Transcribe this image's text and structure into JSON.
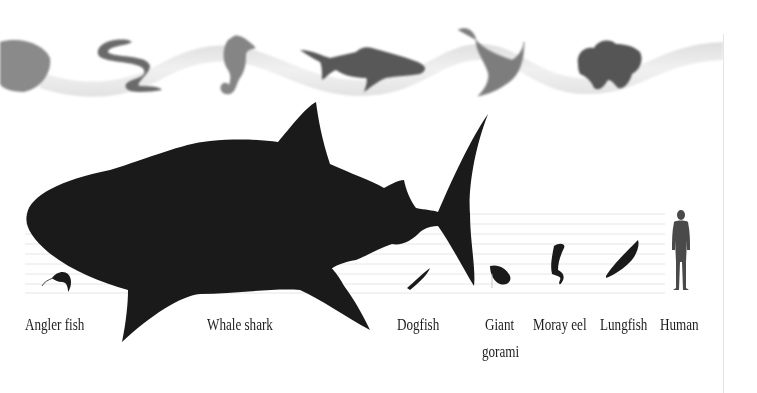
{
  "figure": {
    "type": "size-comparison",
    "banner": {
      "description": "Wavy grey ribbon with greyscale sea creatures",
      "creatures": [
        "fish-partial",
        "eel",
        "seahorse",
        "shark",
        "manta-ray",
        "lionfish"
      ]
    },
    "scale": {
      "gridline_count": 9,
      "gridline_color": "#e6e6e6",
      "silhouette_color": "#1a1a1a",
      "human_color": "#4a4a4a"
    },
    "animals": [
      {
        "name": "Angler fish",
        "icon": "angler-fish-icon"
      },
      {
        "name": "Whale shark",
        "icon": "whale-shark-icon"
      },
      {
        "name": "Dogfish",
        "icon": "dogfish-icon"
      },
      {
        "name": "Giant\ngorami",
        "line1": "Giant",
        "line2": "gorami",
        "icon": "giant-gorami-icon"
      },
      {
        "name": "Moray eel",
        "icon": "moray-eel-icon"
      },
      {
        "name": "Lungfish",
        "icon": "lungfish-icon"
      },
      {
        "name": "Human",
        "icon": "human-icon"
      }
    ]
  }
}
